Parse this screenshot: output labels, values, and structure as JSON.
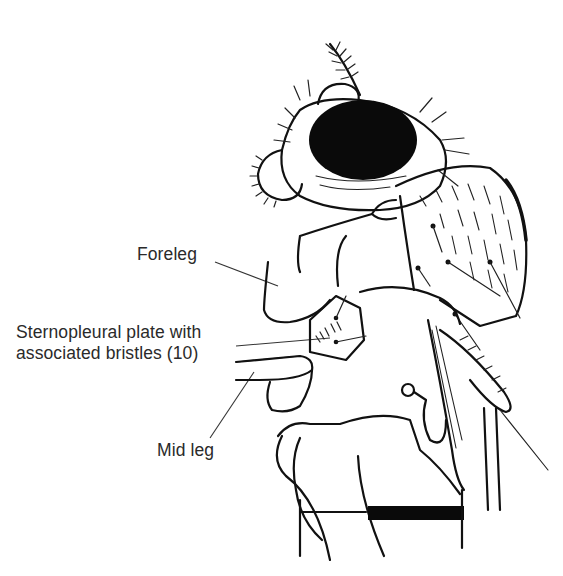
{
  "figure": {
    "ink_color": "#111111",
    "background_color": "#ffffff",
    "labels": {
      "foreleg": "Foreleg",
      "sternopleural_line1": "Sternopleural plate with",
      "sternopleural_line2": "associated bristles (10)",
      "mid_leg": "Mid leg"
    }
  }
}
